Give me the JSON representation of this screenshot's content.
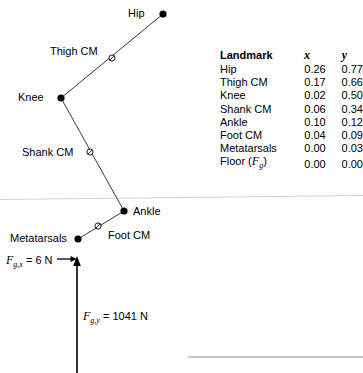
{
  "diagram": {
    "labels": {
      "hip": "Hip",
      "thigh_cm": "Thigh CM",
      "knee": "Knee",
      "shank_cm": "Shank CM",
      "ankle": "Ankle",
      "metatarsals": "Metatarsals",
      "foot_cm": "Foot CM"
    },
    "forces": {
      "horizontal": {
        "symbol": "F",
        "subscript": "g,x",
        "equals": " = 6 N",
        "value": 6,
        "unit": "N",
        "full_text": "Fg,x = 6 N"
      },
      "vertical": {
        "symbol": "F",
        "subscript": "g,y",
        "equals": " = 1041 N",
        "value": 1041,
        "unit": "N",
        "full_text": "Fg,y = 1041 N"
      }
    },
    "colors": {
      "ink": "#000000",
      "segment_line": "#3a3a3a",
      "floor_line": "#d0d0d0",
      "rule_line": "#8a8a8a"
    },
    "points": {
      "hip": {
        "px": 163,
        "py": 14,
        "marker": "filled"
      },
      "thigh_cm": {
        "px": 112,
        "py": 58,
        "marker": "open"
      },
      "knee": {
        "px": 61,
        "py": 98,
        "marker": "filled"
      },
      "shank_cm": {
        "px": 90,
        "py": 152,
        "marker": "open"
      },
      "ankle": {
        "px": 124,
        "py": 211,
        "marker": "filled"
      },
      "foot_cm": {
        "px": 98,
        "py": 226,
        "marker": "open"
      },
      "metatarsals": {
        "px": 78,
        "py": 239,
        "marker": "filled"
      }
    }
  },
  "table": {
    "headers": {
      "landmark": "Landmark",
      "x": "x",
      "y": "y"
    },
    "rows": [
      {
        "landmark": "Hip",
        "x": "0.26",
        "y": "0.77"
      },
      {
        "landmark": "Thigh CM",
        "x": "0.17",
        "y": "0.66"
      },
      {
        "landmark": "Knee",
        "x": "0.02",
        "y": "0.50"
      },
      {
        "landmark": "Shank CM",
        "x": "0.06",
        "y": "0.34"
      },
      {
        "landmark": "Ankle",
        "x": "0.10",
        "y": "0.12"
      },
      {
        "landmark": "Foot CM",
        "x": "0.04",
        "y": "0.09"
      },
      {
        "landmark": "Metatarsals",
        "x": "0.00",
        "y": "0.03"
      },
      {
        "landmark": "Floor (Fg)",
        "x": "0.00",
        "y": "0.00",
        "prefix": "Floor (",
        "var": "F",
        "sub": "g",
        "suffix": ")"
      }
    ]
  }
}
